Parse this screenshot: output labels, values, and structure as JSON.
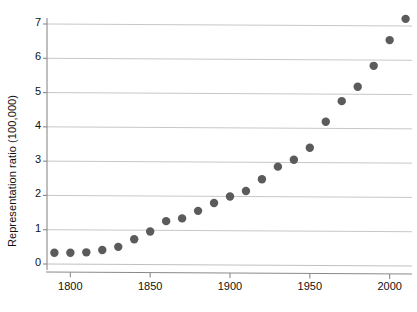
{
  "chart_data": {
    "type": "scatter",
    "title": "",
    "subtitle": "",
    "xlabel": "",
    "ylabel": "Representation ratio (100,000)",
    "xlim": [
      1786,
      2014
    ],
    "ylim": [
      -0.2,
      7.35
    ],
    "xticks": [
      1800,
      1850,
      1900,
      1950,
      2000
    ],
    "xtick_labels": [
      "1800",
      "1850",
      "1900",
      "1950",
      "2000"
    ],
    "yticks": [
      0,
      1,
      2,
      3,
      4,
      5,
      6,
      7
    ],
    "ytick_labels": [
      "0",
      "1",
      "2",
      "3",
      "4",
      "5",
      "6",
      "7"
    ],
    "grid": "horizontal",
    "legend": "none",
    "marker_color": "#5b5b5b",
    "marker_size": 4.2,
    "axis_color": "#8a8a8a",
    "grid_color": "#b9b9b9",
    "x": [
      1790,
      1800,
      1810,
      1820,
      1830,
      1840,
      1850,
      1860,
      1870,
      1880,
      1890,
      1900,
      1910,
      1920,
      1930,
      1940,
      1950,
      1960,
      1970,
      1980,
      1990,
      2000,
      2010
    ],
    "values": [
      0.33,
      0.33,
      0.34,
      0.41,
      0.5,
      0.72,
      0.95,
      1.25,
      1.33,
      1.55,
      1.78,
      1.97,
      2.13,
      2.47,
      2.84,
      3.04,
      3.39,
      4.15,
      4.75,
      5.17,
      5.78,
      6.53,
      7.15
    ],
    "points": [
      {
        "x": 1790,
        "y": 0.33
      },
      {
        "x": 1800,
        "y": 0.33
      },
      {
        "x": 1810,
        "y": 0.34
      },
      {
        "x": 1820,
        "y": 0.41
      },
      {
        "x": 1830,
        "y": 0.5
      },
      {
        "x": 1840,
        "y": 0.72
      },
      {
        "x": 1850,
        "y": 0.95
      },
      {
        "x": 1860,
        "y": 1.25
      },
      {
        "x": 1870,
        "y": 1.33
      },
      {
        "x": 1880,
        "y": 1.55
      },
      {
        "x": 1890,
        "y": 1.78
      },
      {
        "x": 1900,
        "y": 1.97
      },
      {
        "x": 1910,
        "y": 2.13
      },
      {
        "x": 1920,
        "y": 2.47
      },
      {
        "x": 1930,
        "y": 2.84
      },
      {
        "x": 1940,
        "y": 3.04
      },
      {
        "x": 1950,
        "y": 3.39
      },
      {
        "x": 1960,
        "y": 4.15
      },
      {
        "x": 1970,
        "y": 4.75
      },
      {
        "x": 1980,
        "y": 5.17
      },
      {
        "x": 1990,
        "y": 5.78
      },
      {
        "x": 2000,
        "y": 6.53
      },
      {
        "x": 2010,
        "y": 7.15
      }
    ]
  }
}
